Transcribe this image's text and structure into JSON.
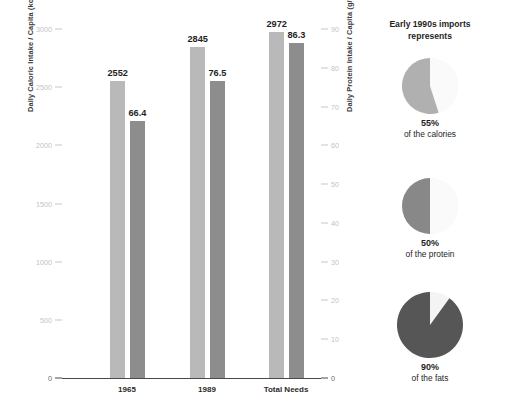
{
  "chart_data": [
    {
      "type": "bar",
      "title": "",
      "categories": [
        "1965",
        "1989",
        "Total Needs"
      ],
      "series": [
        {
          "name": "Daily Caloric Intake / Capita (kcal/day)",
          "axis": "left",
          "values": [
            2552,
            2845,
            2972
          ],
          "color": "#b9b9b9"
        },
        {
          "name": "Daily Protein Intake / Capita (g/day)",
          "axis": "right",
          "values": [
            66.4,
            76.5,
            86.3
          ],
          "color": "#8d8d8d"
        }
      ],
      "value_labels": {
        "calories": [
          "2552",
          "2845",
          "2972"
        ],
        "protein": [
          "66.4",
          "76.5",
          "86.3"
        ]
      },
      "xlabel": "",
      "ylabel": "Daily Caloric Intake / Capita (kcal/day)",
      "ylabel_right": "Daily Protein Intake / Capita (g/day)",
      "ylim": [
        0,
        3000
      ],
      "ylim_right": [
        0,
        90
      ],
      "yticks": [
        0,
        500,
        1000,
        1500,
        2000,
        2500,
        3000
      ],
      "ytick_labels": [
        "0",
        "500",
        "1000",
        "1500",
        "2000",
        "2500",
        "3000"
      ],
      "yticks_right": [
        0,
        10,
        20,
        30,
        40,
        50,
        60,
        70,
        80,
        90
      ],
      "ytick_labels_right": [
        "0",
        "10",
        "20",
        "30",
        "40",
        "50",
        "60",
        "70",
        "80",
        "90"
      ],
      "grid": false,
      "legend": "none"
    },
    {
      "type": "pie",
      "title": "Early 1990s imports represents",
      "slices": [
        {
          "label": "55%",
          "caption": "of the calories",
          "value": 55,
          "color": "#b0b0b0",
          "rest_color": "#fafafa"
        },
        {
          "label": "50%",
          "caption": "of the protein",
          "value": 50,
          "color": "#888888",
          "rest_color": "#fafafa"
        },
        {
          "label": "90%",
          "caption": "of the fats",
          "value": 90,
          "color": "#565656",
          "rest_color": "#f4f4f4"
        }
      ]
    }
  ],
  "bar_chart": {
    "axis_left_label": "Daily Caloric Intake / Capita (kcal/day)",
    "axis_right_label": "Daily Protein Intake / Capita (g/day)",
    "ticks_left": [
      "3000",
      "2500",
      "2000",
      "1500",
      "1000",
      "500",
      "0"
    ],
    "ticks_right": [
      "90",
      "80",
      "70",
      "60",
      "50",
      "40",
      "30",
      "20",
      "10",
      "0"
    ],
    "groups": [
      {
        "label": "1965",
        "calories": "2552",
        "protein": "66.4"
      },
      {
        "label": "1989",
        "calories": "2845",
        "protein": "76.5"
      },
      {
        "label": "Total Needs",
        "calories": "2972",
        "protein": "86.3"
      }
    ]
  },
  "pie_panel": {
    "title_line1": "Early 1990s imports",
    "title_line2": "represents",
    "pies": [
      {
        "percent": "55%",
        "caption": "of the calories"
      },
      {
        "percent": "50%",
        "caption": "of the protein"
      },
      {
        "percent": "90%",
        "caption": "of the fats"
      }
    ]
  }
}
